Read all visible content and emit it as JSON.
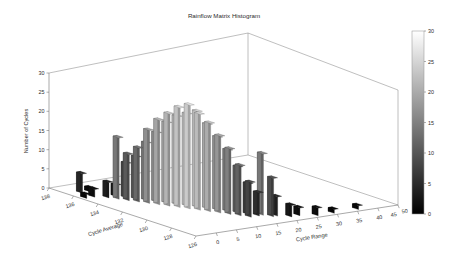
{
  "chart_data": {
    "type": "bar",
    "subtype": "3d-histogram",
    "title": "Rainflow Matrix Histogram",
    "xlabel": "Cycle Range",
    "ylabel": "Cycle Average",
    "zlabel": "Number of Cycles",
    "grid": false,
    "legend": "none",
    "colormap": "gray",
    "xlim": [
      0,
      50
    ],
    "ylim": [
      126,
      138
    ],
    "zlim": [
      0,
      30
    ],
    "x_ticks": [
      0,
      5,
      10,
      15,
      20,
      25,
      30,
      35,
      40,
      45,
      50
    ],
    "y_ticks": [
      138,
      136,
      134,
      132,
      130,
      128,
      126
    ],
    "z_ticks": [
      0,
      5,
      10,
      15,
      20,
      25,
      30
    ],
    "colorbar": {
      "orientation": "vertical",
      "min": 0,
      "max": 30,
      "ticks": [
        0,
        5,
        10,
        15,
        20,
        25,
        30
      ],
      "low_color": "#000000",
      "high_color": "#ffffff"
    },
    "bins": [
      {
        "x": 1.5,
        "y": 135.5,
        "z": 1
      },
      {
        "x": 3.5,
        "y": 136.5,
        "z": 5
      },
      {
        "x": 3.5,
        "y": 135.5,
        "z": 2
      },
      {
        "x": 5.5,
        "y": 136.5,
        "z": 1
      },
      {
        "x": 5.5,
        "y": 135.0,
        "z": 4
      },
      {
        "x": 6.5,
        "y": 134.5,
        "z": 16
      },
      {
        "x": 7.5,
        "y": 134.0,
        "z": 12
      },
      {
        "x": 7.5,
        "y": 135.0,
        "z": 3
      },
      {
        "x": 8.5,
        "y": 133.5,
        "z": 14
      },
      {
        "x": 8.5,
        "y": 134.5,
        "z": 9
      },
      {
        "x": 9.5,
        "y": 133.0,
        "z": 19
      },
      {
        "x": 9.5,
        "y": 134.0,
        "z": 11
      },
      {
        "x": 10.5,
        "y": 132.5,
        "z": 22
      },
      {
        "x": 10.5,
        "y": 133.5,
        "z": 15
      },
      {
        "x": 11.5,
        "y": 132.0,
        "z": 24
      },
      {
        "x": 11.5,
        "y": 133.0,
        "z": 18
      },
      {
        "x": 12.5,
        "y": 131.5,
        "z": 26
      },
      {
        "x": 12.5,
        "y": 132.5,
        "z": 21
      },
      {
        "x": 13.5,
        "y": 131.0,
        "z": 27
      },
      {
        "x": 13.5,
        "y": 132.0,
        "z": 23
      },
      {
        "x": 14.5,
        "y": 130.5,
        "z": 25
      },
      {
        "x": 14.5,
        "y": 131.5,
        "z": 24
      },
      {
        "x": 15.5,
        "y": 130.0,
        "z": 23
      },
      {
        "x": 15.5,
        "y": 131.0,
        "z": 25
      },
      {
        "x": 16.5,
        "y": 129.5,
        "z": 20
      },
      {
        "x": 16.5,
        "y": 130.5,
        "z": 22
      },
      {
        "x": 17.5,
        "y": 129.0,
        "z": 17
      },
      {
        "x": 17.5,
        "y": 130.0,
        "z": 19
      },
      {
        "x": 18.5,
        "y": 128.5,
        "z": 13
      },
      {
        "x": 18.5,
        "y": 129.5,
        "z": 16
      },
      {
        "x": 19.5,
        "y": 128.0,
        "z": 9
      },
      {
        "x": 19.5,
        "y": 129.0,
        "z": 12
      },
      {
        "x": 20.5,
        "y": 128.5,
        "z": 8
      },
      {
        "x": 21.5,
        "y": 128.0,
        "z": 6
      },
      {
        "x": 22.5,
        "y": 128.0,
        "z": 16
      },
      {
        "x": 23.5,
        "y": 127.5,
        "z": 10
      },
      {
        "x": 24.5,
        "y": 127.5,
        "z": 5
      },
      {
        "x": 26.5,
        "y": 127.0,
        "z": 3
      },
      {
        "x": 28.5,
        "y": 127.0,
        "z": 2
      },
      {
        "x": 31.5,
        "y": 126.5,
        "z": 2
      },
      {
        "x": 35.5,
        "y": 126.5,
        "z": 1
      },
      {
        "x": 41.5,
        "y": 126.5,
        "z": 1
      }
    ]
  },
  "figure": {
    "background_color": "#ffffff",
    "axis_color": "#6e6e6e",
    "text_color": "#2b2b2b"
  }
}
